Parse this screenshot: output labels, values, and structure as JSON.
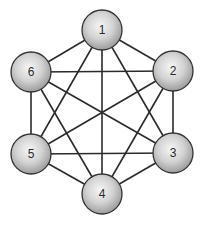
{
  "diagram": {
    "type": "complete-graph",
    "name": "K6",
    "colors": {
      "edge": "#2b2b2b",
      "node_outline": "#333333",
      "node_fill_highlight": "#f4f4f4",
      "node_fill_shadow": "#a6a6a6",
      "label": "#2a2a2a",
      "background": "#ffffff"
    },
    "node_radius": 20,
    "nodes": [
      {
        "id": "1",
        "label": "1",
        "x": 102,
        "y": 30
      },
      {
        "id": "2",
        "label": "2",
        "x": 173,
        "y": 71
      },
      {
        "id": "3",
        "label": "3",
        "x": 173,
        "y": 153
      },
      {
        "id": "4",
        "label": "4",
        "x": 102,
        "y": 194
      },
      {
        "id": "5",
        "label": "5",
        "x": 31,
        "y": 154
      },
      {
        "id": "6",
        "label": "6",
        "x": 31,
        "y": 72
      }
    ],
    "edges": [
      [
        "1",
        "2"
      ],
      [
        "1",
        "3"
      ],
      [
        "1",
        "4"
      ],
      [
        "1",
        "5"
      ],
      [
        "1",
        "6"
      ],
      [
        "2",
        "3"
      ],
      [
        "2",
        "4"
      ],
      [
        "2",
        "5"
      ],
      [
        "2",
        "6"
      ],
      [
        "3",
        "4"
      ],
      [
        "3",
        "5"
      ],
      [
        "3",
        "6"
      ],
      [
        "4",
        "5"
      ],
      [
        "4",
        "6"
      ],
      [
        "5",
        "6"
      ]
    ]
  }
}
